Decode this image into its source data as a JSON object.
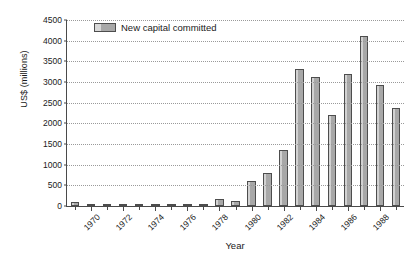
{
  "chart_data": {
    "type": "bar",
    "title": "",
    "xlabel": "Year",
    "ylabel": "US$ (millions)",
    "ylim": [
      0,
      4500
    ],
    "ytick_step": 500,
    "yticks": [
      0,
      500,
      1000,
      1500,
      2000,
      2500,
      3000,
      3500,
      4000,
      4500
    ],
    "grid": true,
    "legend_position": "top-left-inside",
    "series": [
      {
        "name": "New capital committed",
        "color": "#b3b3b3",
        "values": [
          100,
          50,
          60,
          15,
          20,
          15,
          5,
          15,
          10,
          180,
          110,
          610,
          810,
          1350,
          3320,
          3110,
          2210,
          3200,
          4110,
          2930,
          2360
        ]
      }
    ],
    "categories": [
      "1969",
      "1970",
      "1971",
      "1972",
      "1973",
      "1974",
      "1975",
      "1976",
      "1977",
      "1978",
      "1979",
      "1980",
      "1981",
      "1982",
      "1983",
      "1984",
      "1985",
      "1986",
      "1987",
      "1988",
      "1989"
    ],
    "labeled_categories": [
      "1970",
      "1972",
      "1974",
      "1976",
      "1978",
      "1980",
      "1982",
      "1984",
      "1986",
      "1988"
    ],
    "xtick_rotation": -45
  },
  "legend": {
    "label": "New capital committed"
  },
  "axes": {
    "x_title": "Year",
    "y_title": "US$ (millions)"
  }
}
